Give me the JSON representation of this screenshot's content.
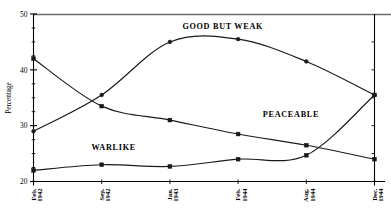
{
  "chart_data": {
    "type": "line",
    "title": "",
    "xlabel": "",
    "ylabel": "Percentage",
    "ylim": [
      20,
      50
    ],
    "grid": false,
    "legend_position": "inline-annotations",
    "categories": [
      "Feb. 1942",
      "Sep. 1942",
      "Jan. 1943",
      "Feb. 1944",
      "Aug. 1944",
      "Dec. 1944"
    ],
    "y_ticks": [
      "20",
      "30",
      "40",
      "50"
    ],
    "y_tick_values": [
      20,
      30,
      40,
      50
    ],
    "y_minor_ticks": [
      22.5,
      25,
      27.5,
      32.5,
      35,
      37.5,
      42.5,
      45,
      47.5
    ],
    "series": [
      {
        "name": "GOOD BUT WEAK",
        "marker": "circle",
        "values": [
          29.0,
          35.5,
          45.0,
          45.5,
          41.5,
          35.5
        ]
      },
      {
        "name": "PEACEABLE",
        "marker": "square",
        "values": [
          42.0,
          33.5,
          31.0,
          28.5,
          26.5,
          24.0
        ]
      },
      {
        "name": "WARLIKE",
        "marker": "square",
        "values": [
          22.0,
          23.0,
          22.7,
          24.0,
          24.7,
          35.5
        ]
      }
    ],
    "annotations": [
      {
        "text": "GOOD BUT WEAK",
        "x_frac": 0.555,
        "y_value": 47.3
      },
      {
        "text": "PEACEABLE",
        "x_frac": 0.755,
        "y_value": 31.6
      },
      {
        "text": "WARLIKE",
        "x_frac": 0.235,
        "y_value": 25.6
      }
    ]
  }
}
